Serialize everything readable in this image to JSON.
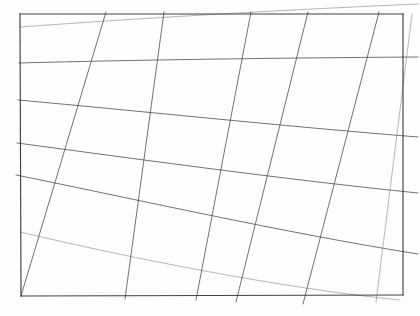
{
  "figure": {
    "medium": "pencil line drawing on white paper",
    "background_color": "#fdfdfd",
    "line_color": "#3a3a3a",
    "faint_line_color": "#6b6b6b",
    "frame_color": "#2e2e2e"
  },
  "frame": {
    "name": "border-rectangle",
    "corners": {
      "top_left": [
        20,
        14
      ],
      "top_right": [
        403,
        14
      ],
      "bottom_right": [
        403,
        295
      ],
      "bottom_left": [
        21,
        296
      ]
    },
    "edges": [
      {
        "name": "top-edge",
        "from": [
          20,
          14
        ],
        "to": [
          403,
          14
        ]
      },
      {
        "name": "right-edge",
        "from": [
          403,
          14
        ],
        "to": [
          403,
          295
        ]
      },
      {
        "name": "bottom-edge",
        "from": [
          403,
          295
        ],
        "to": [
          21,
          296
        ]
      },
      {
        "name": "left-edge",
        "from": [
          21,
          296
        ],
        "to": [
          20,
          14
        ]
      }
    ]
  },
  "chart_data": {
    "type": "line",
    "xlabel": "",
    "ylabel": "",
    "xlim": [
      0,
      420
    ],
    "ylim": [
      0,
      316
    ],
    "grid": false,
    "legend": "none",
    "annotations": [],
    "series": [
      {
        "name": "family-a-line-1",
        "note": "shallow lines descending left-to-right, converging toward a right vanishing point",
        "x": [
          20,
          403
        ],
        "y": [
          27,
          5
        ]
      },
      {
        "name": "family-a-line-2",
        "x": [
          20,
          403
        ],
        "y": [
          63,
          58
        ]
      },
      {
        "name": "family-a-line-3",
        "x": [
          20,
          403
        ],
        "y": [
          100,
          135
        ]
      },
      {
        "name": "family-a-line-4",
        "x": [
          20,
          403
        ],
        "y": [
          143,
          190
        ]
      },
      {
        "name": "family-a-line-5",
        "x": [
          20,
          403
        ],
        "y": [
          175,
          251
        ]
      },
      {
        "name": "family-a-line-6",
        "x": [
          21,
          375
        ],
        "y": [
          296,
          295
        ]
      },
      {
        "name": "family-b-line-1",
        "note": "steep lines rising right-to-left, converging toward a lower-left vanishing point",
        "x": [
          21,
          105
        ],
        "y": [
          296,
          14
        ]
      },
      {
        "name": "family-b-line-2",
        "x": [
          125,
          163
        ],
        "y": [
          296,
          14
        ]
      },
      {
        "name": "family-b-line-3",
        "x": [
          196,
          250
        ],
        "y": [
          296,
          14
        ]
      },
      {
        "name": "family-b-line-4",
        "x": [
          236,
          307
        ],
        "y": [
          296,
          14
        ]
      },
      {
        "name": "family-b-line-5",
        "x": [
          303,
          378
        ],
        "y": [
          296,
          14
        ]
      },
      {
        "name": "family-b-line-6",
        "x": [
          375,
          410
        ],
        "y": [
          295,
          14
        ]
      }
    ],
    "intersection_count": 36
  }
}
